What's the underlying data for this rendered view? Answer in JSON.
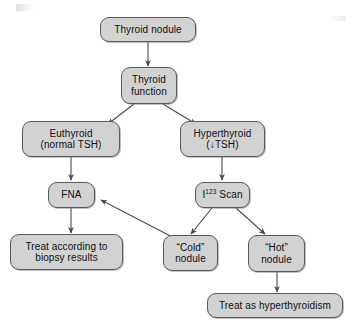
{
  "diagram": {
    "type": "flowchart",
    "background_color": "#ffffff",
    "node_fill_color": "#d2d2d2",
    "node_border_color": "#5a5a5a",
    "connector_color": "#4a4a4a",
    "text_color": "#101010"
  },
  "nodes": {
    "thyroid_nodule": {
      "line1": "Thyroid nodule",
      "line2": ""
    },
    "thyroid_function": {
      "line1": "Thyroid",
      "line2": "function"
    },
    "euthyroid": {
      "line1": "Euthyroid",
      "line2": "(normal TSH)"
    },
    "hyperthyroid": {
      "line1": "Hyperthyroid",
      "line2": "(↓TSH)"
    },
    "fna": {
      "line1": "FNA",
      "line2": ""
    },
    "i123_scan": {
      "line1_pre": "I",
      "line1_sup": "123",
      "line1_post": " Scan",
      "line2": ""
    },
    "treat_biopsy": {
      "line1": "Treat according to",
      "line2": "biopsy results"
    },
    "cold_nodule": {
      "line1": "“Cold”",
      "line2": "nodule"
    },
    "hot_nodule": {
      "line1": "“Hot”",
      "line2": "nodule"
    },
    "treat_hyperthyroidism": {
      "line1": "Treat as hyperthyroidism",
      "line2": ""
    }
  },
  "edges": [
    {
      "name": "nodule-to-function",
      "from": "thyroid_nodule",
      "to": "thyroid_function",
      "style": "straight-down"
    },
    {
      "name": "function-to-euthyroid",
      "from": "thyroid_function",
      "to": "euthyroid",
      "style": "diagonal-left"
    },
    {
      "name": "function-to-hyperthyroid",
      "from": "thyroid_function",
      "to": "hyperthyroid",
      "style": "diagonal-right"
    },
    {
      "name": "euthyroid-to-fna",
      "from": "euthyroid",
      "to": "fna",
      "style": "straight-down"
    },
    {
      "name": "hyperthyroid-to-scan",
      "from": "hyperthyroid",
      "to": "i123_scan",
      "style": "straight-down"
    },
    {
      "name": "fna-to-treat-biopsy",
      "from": "fna",
      "to": "treat_biopsy",
      "style": "straight-down"
    },
    {
      "name": "scan-to-cold",
      "from": "i123_scan",
      "to": "cold_nodule",
      "style": "diagonal-left"
    },
    {
      "name": "scan-to-hot",
      "from": "i123_scan",
      "to": "hot_nodule",
      "style": "diagonal-right"
    },
    {
      "name": "cold-to-fna",
      "from": "cold_nodule",
      "to": "fna",
      "style": "diagonal-up-left"
    },
    {
      "name": "hot-to-treat-hyperthyroidism",
      "from": "hot_nodule",
      "to": "treat_hyperthyroidism",
      "style": "straight-down"
    }
  ]
}
